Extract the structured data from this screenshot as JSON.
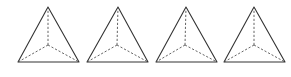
{
  "diagram": {
    "type": "tetrahedron-wireframes",
    "count": 4,
    "colors": {
      "background": "#ffffff",
      "solid_edge": "#333333",
      "hidden_edge": "#555555"
    },
    "figures": [
      {
        "id": 1,
        "apex": [
          48,
          7
        ],
        "base_left": [
          18,
          62
        ],
        "base_right": [
          79,
          62
        ],
        "interior": [
          48,
          45
        ]
      },
      {
        "id": 2,
        "apex": [
          118,
          7
        ],
        "base_left": [
          87,
          62
        ],
        "base_right": [
          148,
          62
        ],
        "interior": [
          117,
          45
        ]
      },
      {
        "id": 3,
        "apex": [
          186,
          7
        ],
        "base_left": [
          156,
          62
        ],
        "base_right": [
          217,
          62
        ],
        "interior": [
          185,
          45
        ]
      },
      {
        "id": 4,
        "apex": [
          254,
          7
        ],
        "base_left": [
          224,
          62
        ],
        "base_right": [
          285,
          62
        ],
        "interior": [
          254,
          45
        ]
      }
    ],
    "edge_styles": {
      "outer": "solid",
      "interior_to_vertices": "dashed"
    }
  }
}
